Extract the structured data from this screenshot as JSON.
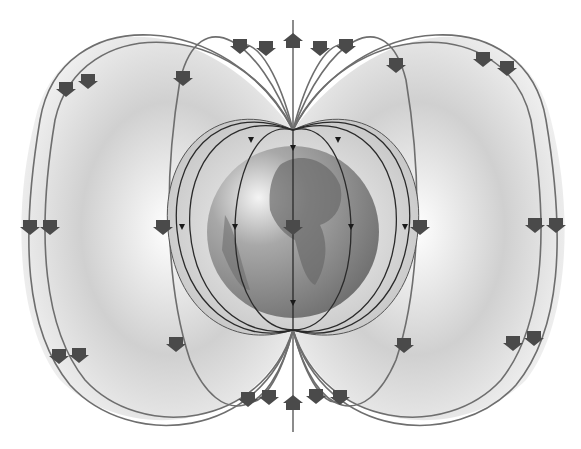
{
  "illustration": {
    "subject": "Earth magnetic field lines diagram",
    "colors": {
      "background": "#ffffff",
      "field_shading": "#b8b8b8",
      "field_line": "#6e6e6e",
      "inner_line": "#2a2a2a",
      "arrow": "#4a4a4a",
      "globe_ocean": "#8a8a8a",
      "globe_land": "#6a6a6a"
    }
  }
}
